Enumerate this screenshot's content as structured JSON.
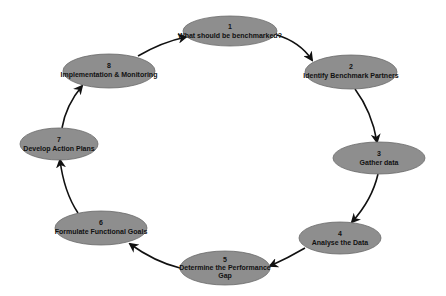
{
  "diagram": {
    "type": "cycle",
    "colors": {
      "node_fill": "#8e8e8e",
      "node_stroke": "#6a6a6a",
      "arrow": "#111111",
      "text": "#111111",
      "background": "#ffffff"
    },
    "nodes": [
      {
        "number": "1",
        "line1": "What should be benchmarked?",
        "line2": ""
      },
      {
        "number": "2",
        "line1": "Identify Benchmark Partners",
        "line2": ""
      },
      {
        "number": "3",
        "line1": "Gather data",
        "line2": ""
      },
      {
        "number": "4",
        "line1": "Analyse the Data",
        "line2": ""
      },
      {
        "number": "5",
        "line1": "Determine the Performance",
        "line2": "Gap"
      },
      {
        "number": "6",
        "line1": "Formulate Functional Goals",
        "line2": ""
      },
      {
        "number": "7",
        "line1": "Develop Action Plans",
        "line2": ""
      },
      {
        "number": "8",
        "line1": "Implementation & Monitoring",
        "line2": ""
      }
    ],
    "edges": [
      {
        "from": "1",
        "to": "2"
      },
      {
        "from": "2",
        "to": "3"
      },
      {
        "from": "3",
        "to": "4"
      },
      {
        "from": "4",
        "to": "5"
      },
      {
        "from": "5",
        "to": "6"
      },
      {
        "from": "6",
        "to": "7"
      },
      {
        "from": "7",
        "to": "8"
      },
      {
        "from": "8",
        "to": "1"
      }
    ]
  }
}
